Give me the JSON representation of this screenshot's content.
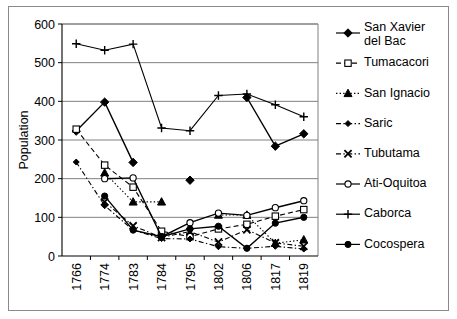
{
  "chart_data": {
    "type": "line",
    "title": "",
    "xlabel": "",
    "ylabel": "Population",
    "ylim": [
      0,
      600
    ],
    "yticks": [
      0,
      100,
      200,
      300,
      400,
      500,
      600
    ],
    "grid": "horizontal",
    "legend_position": "right",
    "categories": [
      "1766",
      "1774",
      "1783",
      "1784",
      "1795",
      "1802",
      "1806",
      "1817",
      "1819"
    ],
    "series": [
      {
        "name": "San Xavier del Bac",
        "marker": "filled-diamond",
        "linestyle": "solid",
        "values": [
          323,
          398,
          242,
          null,
          196,
          null,
          410,
          284,
          316
        ]
      },
      {
        "name": "Tumacacori",
        "marker": "open-square",
        "linestyle": "dashed",
        "values": [
          328,
          235,
          178,
          64,
          50,
          70,
          82,
          103,
          120
        ]
      },
      {
        "name": "San Ignacio",
        "marker": "filled-triangle",
        "linestyle": "dotted",
        "values": [
          null,
          215,
          140,
          140,
          null,
          106,
          106,
          33,
          42
        ]
      },
      {
        "name": "Saric",
        "marker": "filled-diamond-small",
        "linestyle": "dash-dot",
        "values": [
          243,
          130,
          67,
          45,
          44,
          24,
          20,
          25,
          18
        ]
      },
      {
        "name": "Tubutama",
        "marker": "x-cross",
        "linestyle": "dash-dot",
        "values": [
          null,
          140,
          78,
          48,
          63,
          36,
          68,
          34,
          25
        ]
      },
      {
        "name": "Ati-Oquitoa",
        "marker": "open-circle",
        "linestyle": "solid",
        "values": [
          null,
          200,
          202,
          50,
          86,
          111,
          105,
          125,
          143
        ]
      },
      {
        "name": "Caborca",
        "marker": "plus",
        "linestyle": "solid",
        "values": [
          549,
          532,
          548,
          331,
          324,
          415,
          419,
          391,
          360
        ]
      },
      {
        "name": "Cocospera",
        "marker": "filled-circle",
        "linestyle": "solid",
        "values": [
          null,
          155,
          67,
          50,
          70,
          77,
          20,
          85,
          100
        ]
      }
    ]
  },
  "legend": {
    "items": [
      {
        "label": "San Xavier del Bac",
        "line": "solid",
        "marker": "filled-diamond"
      },
      {
        "label": "Tumacacori",
        "line": "dashed",
        "marker": "open-square"
      },
      {
        "label": "San Ignacio",
        "line": "dotted",
        "marker": "filled-triangle"
      },
      {
        "label": "Saric",
        "line": "dash-dot",
        "marker": "filled-diamond-small"
      },
      {
        "label": "Tubutama",
        "line": "dash-dot",
        "marker": "x-cross"
      },
      {
        "label": "Ati-Oquitoa",
        "line": "solid",
        "marker": "open-circle"
      },
      {
        "label": "Caborca",
        "line": "solid",
        "marker": "plus"
      },
      {
        "label": "Cocospera",
        "line": "solid",
        "marker": "filled-circle"
      }
    ]
  },
  "colors": {
    "ink": "#000000",
    "grid": "#808080",
    "frame": "#8a8a8a",
    "background": "#ffffff"
  }
}
